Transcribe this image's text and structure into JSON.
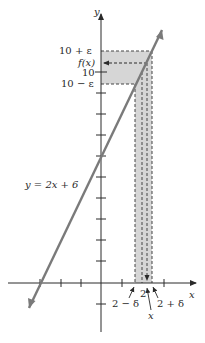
{
  "diagram": {
    "type": "epsilon-delta limit illustration",
    "equation_label": "y = 2x + 6",
    "axes": {
      "x_label": "x",
      "y_label": "y"
    },
    "y_labels": {
      "upper": "10 + ε",
      "fx": "f(x)",
      "center": "10",
      "lower": "10 − ε"
    },
    "x_labels": {
      "left": "2 − δ",
      "center": "2",
      "point": "x",
      "right": "2 + δ"
    },
    "colors": {
      "line": "#7a7a7a",
      "shade": "#d6d6d6",
      "axis": "#2a2a2a",
      "dash": "#444444"
    }
  }
}
